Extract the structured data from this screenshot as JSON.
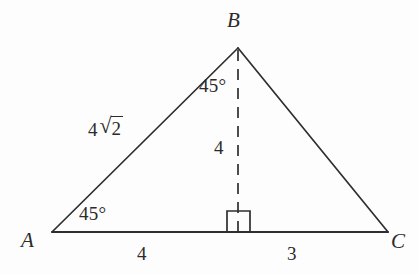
{
  "figure": {
    "kind": "geometry-diagram",
    "shape": "triangle",
    "background_color": "#fdfdfd",
    "stroke_color": "#2e2e2e",
    "text_color": "#2b2b2b"
  },
  "vertices": [
    {
      "name": "A",
      "label": "A",
      "x": 52,
      "y": 232
    },
    {
      "name": "B",
      "label": "B",
      "x": 238,
      "y": 48
    },
    {
      "name": "C",
      "label": "C",
      "x": 388,
      "y": 232
    }
  ],
  "foot_of_altitude": {
    "name": "D",
    "x": 238,
    "y": 232
  },
  "angles": [
    {
      "at": "A",
      "label": "45°"
    },
    {
      "at": "B",
      "label": "45°"
    },
    {
      "at": "D",
      "label": "right-angle-marker"
    }
  ],
  "lengths": {
    "side_AB": {
      "coefficient": "4",
      "radical_sign": "√",
      "radicand": "2",
      "plain": "4√2"
    },
    "altitude_BD": "4",
    "segment_AD": "4",
    "segment_DC": "3"
  },
  "edges": [
    {
      "name": "AB",
      "from": "A",
      "to": "B",
      "style": "solid"
    },
    {
      "name": "BC",
      "from": "B",
      "to": "C",
      "style": "solid"
    },
    {
      "name": "AC",
      "from": "A",
      "to": "C",
      "style": "solid"
    },
    {
      "name": "BD",
      "from": "B",
      "to": "D",
      "style": "dashed"
    }
  ]
}
